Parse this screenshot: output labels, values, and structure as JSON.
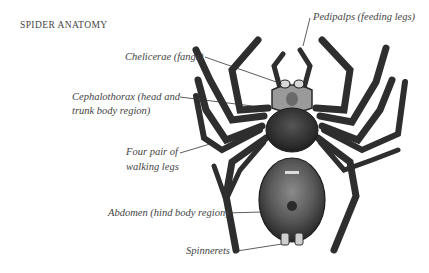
{
  "title": "SPIDER ANATOMY",
  "labels": {
    "pedipalps": "Pedipalps (feeding legs)",
    "chelicerae": "Chelicerae (fangs)",
    "cephalothorax_line1": "Cephalothorax (head and",
    "cephalothorax_line2": "trunk body region)",
    "legs_line1": "Four pair of",
    "legs_line2": "walking legs",
    "abdomen": "Abdomen (hind body region)",
    "spinnerets": "Spinnerets"
  },
  "colors": {
    "background": "#ffffff",
    "text": "#444444",
    "spider_dark": "#2b2b2b",
    "spider_mid": "#555555",
    "spider_light": "#9a9a9a",
    "leader_line": "#333333"
  }
}
